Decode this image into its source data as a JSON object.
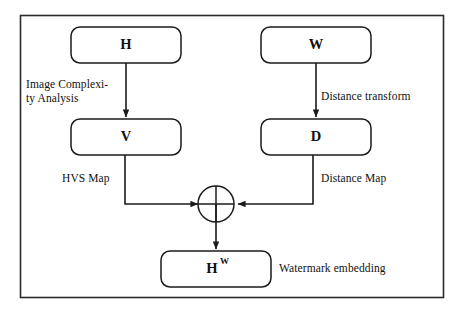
{
  "diagram": {
    "colors": {
      "frame_stroke": "#2b2b2b",
      "node_stroke": "#1b1b1b",
      "connector_stroke": "#1b1b1b",
      "background": "#ffffff",
      "text": "#111111"
    },
    "nodes": {
      "host_image": {
        "label": "H"
      },
      "watermark": {
        "label": "W"
      },
      "hvs_map": {
        "label": "V"
      },
      "distance_map": {
        "label": "D"
      },
      "watermarked": {
        "label": "H",
        "superscript": "W"
      }
    },
    "edge_labels": {
      "image_complexity_analysis": "Image Complexi-\nty Analysis",
      "distance_transform": "Distance transform",
      "hvs_map": "HVS Map",
      "distance_map": "Distance Map",
      "watermark_embedding": "Watermark embedding"
    },
    "junction": {
      "name": "combine-junction",
      "glyph": "cross"
    }
  }
}
